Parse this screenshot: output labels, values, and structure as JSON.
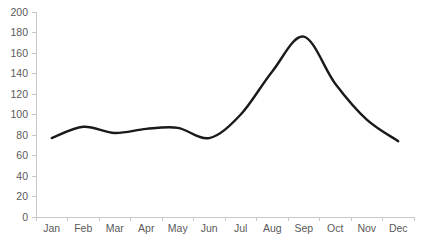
{
  "chart_data": {
    "type": "line",
    "title": "",
    "subtitle": "",
    "xlabel": "",
    "ylabel": "",
    "categories": [
      "Jan",
      "Feb",
      "Mar",
      "Apr",
      "May",
      "Jun",
      "Jul",
      "Aug",
      "Sep",
      "Oct",
      "Nov",
      "Dec"
    ],
    "values": [
      77,
      88,
      82,
      86,
      87,
      77,
      100,
      142,
      176,
      130,
      95,
      74
    ],
    "series": [
      {
        "name": "",
        "values": [
          77,
          88,
          82,
          86,
          87,
          77,
          100,
          142,
          176,
          130,
          95,
          74
        ]
      }
    ],
    "ylim": [
      0,
      200
    ],
    "y_ticks": [
      0,
      20,
      40,
      60,
      80,
      100,
      120,
      140,
      160,
      180,
      200
    ],
    "y_tick_labels": [
      "0",
      "20",
      "40",
      "60",
      "80",
      "100",
      "120",
      "140",
      "160",
      "180",
      "200"
    ],
    "x_tick_labels": [
      "Jan",
      "Feb",
      "Mar",
      "Apr",
      "May",
      "Jun",
      "Jul",
      "Aug",
      "Sep",
      "Oct",
      "Nov",
      "Dec"
    ],
    "grid": false,
    "legend": false,
    "legend_position": "none",
    "markers": false,
    "smoothing": "spline",
    "annotations": [],
    "colors": {
      "line": "#1a1a1a",
      "axis": "#c8c8c8",
      "tick_label": "#5a5a5a",
      "background": "#ffffff"
    }
  },
  "geometry": {
    "width": 422,
    "height": 241,
    "plot_left": 36,
    "plot_right": 414,
    "plot_top": 12,
    "plot_bottom": 217,
    "value_min": 0,
    "value_max": 200,
    "x_label_y": 232,
    "y_label_offset_x": 8,
    "tick_len": 4
  }
}
